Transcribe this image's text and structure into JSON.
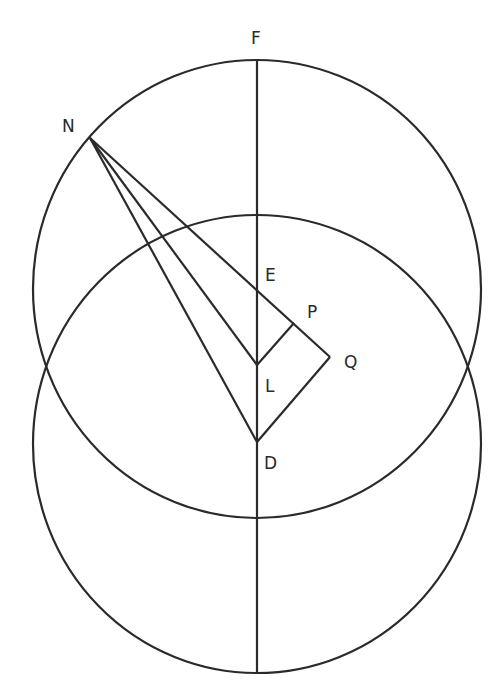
{
  "diagram": {
    "labels": {
      "F": "F",
      "N": "N",
      "E": "E",
      "P": "P",
      "Q": "Q",
      "L": "L",
      "D": "D"
    },
    "points": {
      "F": [
        257,
        60
      ],
      "N": [
        90,
        138
      ],
      "E": [
        257,
        289
      ],
      "P": [
        294,
        323
      ],
      "Q": [
        330,
        357
      ],
      "L": [
        257,
        365
      ],
      "D": [
        257,
        442
      ]
    },
    "circles": [
      {
        "name": "upper-circle",
        "center": "E",
        "cx": 257,
        "cy": 289,
        "rx": 224,
        "ry": 229
      },
      {
        "name": "lower-circle",
        "center": "D",
        "cx": 257,
        "cy": 444,
        "rx": 224,
        "ry": 229
      }
    ],
    "segments": [
      [
        "F",
        "bottom"
      ],
      [
        "N",
        "Q"
      ],
      [
        "N",
        "L"
      ],
      [
        "N",
        "D"
      ],
      [
        "L",
        "P"
      ],
      [
        "D",
        "Q"
      ]
    ],
    "colors": {
      "line": "#2a2a2a",
      "background": "#ffffff"
    }
  }
}
